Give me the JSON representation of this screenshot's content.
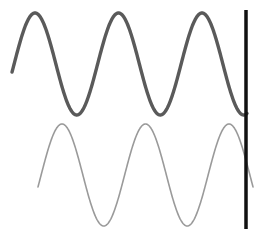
{
  "figure": {
    "title": "",
    "width": 259,
    "height": 241,
    "background_color": "#ffffff"
  },
  "chart_data": {
    "type": "line",
    "title": "",
    "subtitle": "",
    "xlabel": "",
    "ylabel": "",
    "xlim": [
      0,
      259
    ],
    "ylim": [
      0,
      241
    ],
    "grid": false,
    "axes_visible": false,
    "tick_labels_x": [],
    "tick_labels_y": [],
    "legend": {
      "visible": false,
      "position": "none",
      "entries": [
        "upper-waveform",
        "lower-waveform"
      ]
    },
    "annotations": [
      {
        "name": "vertical-marker-line",
        "type": "vline",
        "x": 246,
        "y_start": 10,
        "y_end": 229,
        "color": "#111111",
        "width": 3.5
      }
    ],
    "series": [
      {
        "name": "upper-waveform",
        "shape": "sine",
        "color": "#5a5a5a",
        "line_width": 3.4,
        "amplitude": 51,
        "midline_y": 64,
        "period": 83.5,
        "phase_peak_x": 35,
        "x_start": 12,
        "x_end": 247,
        "peaks": [
          {
            "x": 35,
            "y": 13
          },
          {
            "x": 118,
            "y": 13
          },
          {
            "x": 202,
            "y": 13
          }
        ],
        "troughs": [
          {
            "x": 77,
            "y": 116
          },
          {
            "x": 160,
            "y": 116
          }
        ],
        "start_point": {
          "x": 12,
          "y": 73
        },
        "end_point": {
          "x": 247,
          "y": 114
        }
      },
      {
        "name": "lower-waveform",
        "shape": "sine",
        "color": "#9a9a9a",
        "line_width": 1.6,
        "amplitude": 51,
        "midline_y": 175,
        "period": 83.5,
        "phase_peak_x": 62,
        "x_start": 38,
        "x_end": 253,
        "peaks": [
          {
            "x": 62,
            "y": 124
          },
          {
            "x": 145,
            "y": 124
          },
          {
            "x": 229,
            "y": 124
          }
        ],
        "troughs": [
          {
            "x": 103,
            "y": 226
          },
          {
            "x": 187,
            "y": 226
          }
        ],
        "start_point": {
          "x": 38,
          "y": 184
        },
        "end_point": {
          "x": 253,
          "y": 171
        }
      }
    ]
  }
}
